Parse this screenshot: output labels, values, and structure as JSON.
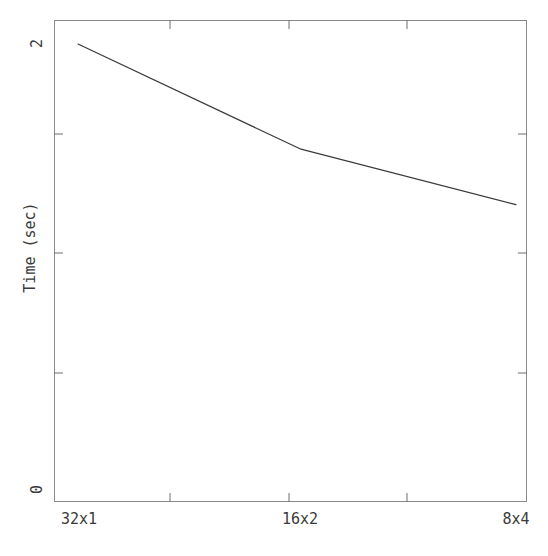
{
  "chart_data": {
    "type": "line",
    "title": "",
    "xlabel": "",
    "ylabel": "Time (sec)",
    "categories": [
      "32x1",
      "16x2",
      "8x4"
    ],
    "values": [
      2.0,
      1.53,
      1.28
    ],
    "series": [
      {
        "name": "Time",
        "values": [
          2.0,
          1.53,
          1.28
        ]
      }
    ],
    "ylim": [
      0,
      2
    ],
    "ytick_labels": [
      "0",
      "2"
    ],
    "ytick_values": [
      0,
      2
    ],
    "xtick_labels": [
      "32x1",
      "16x2",
      "8x4"
    ],
    "grid": false,
    "legend": null,
    "markers": false,
    "line_color": "#3a3a3a",
    "frame_color": "#8a8a8a",
    "background": "#ffffff"
  },
  "axes": {
    "y_top_label": "2",
    "y_bottom_label": "0",
    "y_title": "Time (sec)",
    "x_labels": {
      "first": "32x1",
      "second": "16x2",
      "third": "8x4"
    }
  }
}
